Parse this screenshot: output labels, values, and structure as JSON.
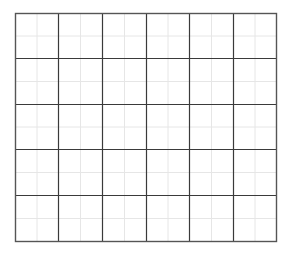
{
  "grid": {
    "columns": 6,
    "rows": 5,
    "origin": [
      15,
      13
    ],
    "size": [
      261,
      228
    ],
    "major_line_color": "#3a3a3a",
    "outer_line_color": "#555555",
    "minor_line_color": "#e6e6e6",
    "minor_subdivisions": 2,
    "column_lines_x": [
      15,
      58,
      102,
      146,
      189,
      233,
      276
    ],
    "row_lines_y": [
      13,
      58,
      104,
      149,
      195,
      241
    ]
  }
}
